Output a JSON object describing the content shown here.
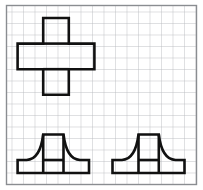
{
  "figure": {
    "canvas": {
      "width": 203,
      "height": 190,
      "background": "#ffffff"
    },
    "grid": {
      "name": "square-grid",
      "x": 6.5,
      "y": 5.5,
      "width": 190,
      "height": 179,
      "cell_size": 11.5,
      "columns": 17,
      "rows": 16,
      "line_color": "#b9bcc0",
      "line_width": 0.9,
      "border_color": "#8a8d91",
      "border_width": 1.4,
      "fill": "#ffffff"
    },
    "stroke": {
      "shape_color": "#111111",
      "shape_width": 2.6,
      "shape_join": "miter",
      "shape_cap": "butt"
    },
    "shapes": [
      {
        "name": "cross-shape",
        "label": "plus / cross polyomino",
        "type": "polygon-with-internal-lines",
        "cells": 5,
        "unit": 25.6,
        "outline": "M 43.2 18.0 L 68.8 18.0 L 68.8 43.6 L 94.4 43.6 L 94.4 69.2 L 68.8 69.2 L 68.8 94.8 L 43.2 94.8 L 43.2 69.2 L 17.6 69.2 L 17.6 43.6 L 43.2 43.6 Z",
        "internal_lines": [
          "M 43.2 43.6 L 68.8 43.6",
          "M 43.2 69.2 L 68.8 69.2"
        ]
      },
      {
        "name": "pedestal-shape-left",
        "label": "symmetric pedestal with concave sides",
        "type": "path-with-internal-lines",
        "base_left": 17.6,
        "base_right": 89.0,
        "base_top": 160.0,
        "base_bottom": 173.0,
        "top_left": 43.2,
        "top_right": 63.5,
        "top_y": 134.5,
        "outline": "M 17.6 173.0 L 89.0 173.0 L 89.0 160.0 L 80.0 160.0 C 71.0 159.6 65.4 150.0 63.5 134.5 L 43.2 134.5 C 41.3 150.0 35.7 159.6 26.6 160.0 L 17.6 160.0 Z",
        "internal_lines": [
          "M 43.2 134.5 L 43.2 173.0",
          "M 63.5 134.5 L 63.5 173.0",
          "M 43.2 160.0 L 63.5 160.0"
        ]
      },
      {
        "name": "pedestal-shape-right",
        "label": "symmetric pedestal with concave sides",
        "type": "path-with-internal-lines",
        "base_left": 112.5,
        "base_right": 184.5,
        "base_top": 160.0,
        "base_bottom": 173.0,
        "top_left": 138.5,
        "top_right": 158.8,
        "top_y": 134.5,
        "outline": "M 112.5 173.0 L 184.5 173.0 L 184.5 160.0 L 175.5 160.0 C 166.4 159.6 160.7 150.0 158.8 134.5 L 138.5 134.5 C 136.6 150.0 131.0 159.6 121.9 160.0 L 112.5 160.0 Z",
        "internal_lines": [
          "M 138.5 134.5 L 138.5 173.0",
          "M 158.8 134.5 L 158.8 173.0",
          "M 138.5 160.0 L 158.8 160.0"
        ]
      }
    ]
  }
}
